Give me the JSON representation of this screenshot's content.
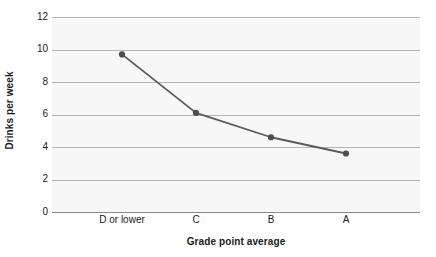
{
  "chart_data": {
    "type": "line",
    "title": "",
    "xlabel": "Grade point average",
    "ylabel": "Drinks per week",
    "categories": [
      "D or lower",
      "C",
      "B",
      "A"
    ],
    "values": [
      9.7,
      6.1,
      4.6,
      3.6
    ],
    "series": [
      {
        "name": "Drinks per week",
        "values": [
          9.7,
          6.1,
          4.6,
          3.6
        ]
      }
    ],
    "ylim": [
      0,
      12
    ],
    "yticks": [
      0,
      2,
      4,
      6,
      8,
      10,
      12
    ],
    "ytick_labels": [
      "0",
      "2",
      "4",
      "6",
      "8",
      "10",
      "12"
    ],
    "xtick_labels": [
      "D or lower",
      "C",
      "B",
      "A"
    ],
    "grid": true,
    "grid_axis": "y",
    "legend": false,
    "legend_position": "none",
    "marker": "circle",
    "colors": {
      "line": "#5a5a5a",
      "marker": "#4d4d4d",
      "grid": "#b4b4b4",
      "axis": "#8a8a8a",
      "plot_background": "#f7f7f7",
      "figure_background": "#ffffff",
      "text": "#1a1a1a"
    }
  }
}
